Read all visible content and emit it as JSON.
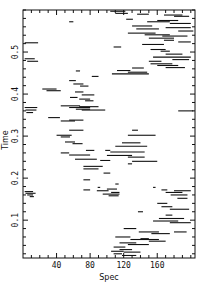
{
  "chart_data": {
    "type": "segments",
    "title": "",
    "xlabel": "Spec",
    "ylabel": "Time",
    "xlim": [
      0,
      205
    ],
    "ylim": [
      0.01,
      0.6
    ],
    "xticks": [
      40,
      80,
      120,
      160
    ],
    "xtick_labels": [
      "40",
      "80",
      "120",
      "160"
    ],
    "yticks": [
      0.1,
      0.2,
      0.3,
      0.4,
      0.5
    ],
    "ytick_labels": [
      "0.1",
      "0.2",
      "0.3",
      "0.4",
      "0.5"
    ],
    "x_minor_step": 10,
    "y_minor_step": 0.02,
    "grid": false,
    "legend": null,
    "segments": [
      {
        "x1": 104,
        "x2": 122,
        "y": 0.597
      },
      {
        "x1": 110,
        "x2": 125,
        "y": 0.592
      },
      {
        "x1": 136,
        "x2": 150,
        "y": 0.59
      },
      {
        "x1": 168,
        "x2": 190,
        "y": 0.588
      },
      {
        "x1": 180,
        "x2": 198,
        "y": 0.585
      },
      {
        "x1": 123,
        "x2": 131,
        "y": 0.578
      },
      {
        "x1": 160,
        "x2": 185,
        "y": 0.575
      },
      {
        "x1": 148,
        "x2": 175,
        "y": 0.572
      },
      {
        "x1": 175,
        "x2": 200,
        "y": 0.568
      },
      {
        "x1": 130,
        "x2": 154,
        "y": 0.562
      },
      {
        "x1": 170,
        "x2": 200,
        "y": 0.558
      },
      {
        "x1": 135,
        "x2": 162,
        "y": 0.555
      },
      {
        "x1": 185,
        "x2": 203,
        "y": 0.55
      },
      {
        "x1": 125,
        "x2": 158,
        "y": 0.545
      },
      {
        "x1": 145,
        "x2": 175,
        "y": 0.541
      },
      {
        "x1": 166,
        "x2": 196,
        "y": 0.538
      },
      {
        "x1": 150,
        "x2": 180,
        "y": 0.533
      },
      {
        "x1": 168,
        "x2": 180,
        "y": 0.528
      },
      {
        "x1": 185,
        "x2": 200,
        "y": 0.524
      },
      {
        "x1": 2,
        "x2": 18,
        "y": 0.522
      },
      {
        "x1": 142,
        "x2": 168,
        "y": 0.518
      },
      {
        "x1": 55,
        "x2": 60,
        "y": 0.572
      },
      {
        "x1": 108,
        "x2": 117,
        "y": 0.512
      },
      {
        "x1": 152,
        "x2": 170,
        "y": 0.506
      },
      {
        "x1": 164,
        "x2": 175,
        "y": 0.502
      },
      {
        "x1": 170,
        "x2": 190,
        "y": 0.495
      },
      {
        "x1": 155,
        "x2": 200,
        "y": 0.488
      },
      {
        "x1": 178,
        "x2": 198,
        "y": 0.482
      },
      {
        "x1": 2,
        "x2": 14,
        "y": 0.484
      },
      {
        "x1": 5,
        "x2": 18,
        "y": 0.478
      },
      {
        "x1": 150,
        "x2": 165,
        "y": 0.478
      },
      {
        "x1": 152,
        "x2": 178,
        "y": 0.472
      },
      {
        "x1": 160,
        "x2": 185,
        "y": 0.468
      },
      {
        "x1": 170,
        "x2": 193,
        "y": 0.463
      },
      {
        "x1": 130,
        "x2": 144,
        "y": 0.462
      },
      {
        "x1": 106,
        "x2": 150,
        "y": 0.448
      },
      {
        "x1": 125,
        "x2": 148,
        "y": 0.452
      },
      {
        "x1": 112,
        "x2": 128,
        "y": 0.456
      },
      {
        "x1": 63,
        "x2": 68,
        "y": 0.455
      },
      {
        "x1": 82,
        "x2": 90,
        "y": 0.442
      },
      {
        "x1": 55,
        "x2": 63,
        "y": 0.432
      },
      {
        "x1": 60,
        "x2": 72,
        "y": 0.424
      },
      {
        "x1": 68,
        "x2": 78,
        "y": 0.419
      },
      {
        "x1": 23,
        "x2": 40,
        "y": 0.412
      },
      {
        "x1": 28,
        "x2": 45,
        "y": 0.408
      },
      {
        "x1": 62,
        "x2": 72,
        "y": 0.405
      },
      {
        "x1": 70,
        "x2": 85,
        "y": 0.398
      },
      {
        "x1": 56,
        "x2": 65,
        "y": 0.392
      },
      {
        "x1": 67,
        "x2": 80,
        "y": 0.388
      },
      {
        "x1": 74,
        "x2": 84,
        "y": 0.384
      },
      {
        "x1": 45,
        "x2": 68,
        "y": 0.372
      },
      {
        "x1": 55,
        "x2": 80,
        "y": 0.368
      },
      {
        "x1": 67,
        "x2": 90,
        "y": 0.37
      },
      {
        "x1": 63,
        "x2": 80,
        "y": 0.364
      },
      {
        "x1": 70,
        "x2": 98,
        "y": 0.362
      },
      {
        "x1": 2,
        "x2": 17,
        "y": 0.368
      },
      {
        "x1": 3,
        "x2": 16,
        "y": 0.362
      },
      {
        "x1": 4,
        "x2": 12,
        "y": 0.356
      },
      {
        "x1": 185,
        "x2": 203,
        "y": 0.36
      },
      {
        "x1": 30,
        "x2": 44,
        "y": 0.344
      },
      {
        "x1": 45,
        "x2": 62,
        "y": 0.336
      },
      {
        "x1": 55,
        "x2": 72,
        "y": 0.338
      },
      {
        "x1": 55,
        "x2": 72,
        "y": 0.314
      },
      {
        "x1": 40,
        "x2": 58,
        "y": 0.302
      },
      {
        "x1": 45,
        "x2": 56,
        "y": 0.298
      },
      {
        "x1": 50,
        "x2": 62,
        "y": 0.286
      },
      {
        "x1": 59,
        "x2": 71,
        "y": 0.282
      },
      {
        "x1": 130,
        "x2": 137,
        "y": 0.314
      },
      {
        "x1": 125,
        "x2": 158,
        "y": 0.302
      },
      {
        "x1": 118,
        "x2": 140,
        "y": 0.284
      },
      {
        "x1": 110,
        "x2": 148,
        "y": 0.276
      },
      {
        "x1": 98,
        "x2": 104,
        "y": 0.266
      },
      {
        "x1": 75,
        "x2": 85,
        "y": 0.266
      },
      {
        "x1": 104,
        "x2": 145,
        "y": 0.262
      },
      {
        "x1": 45,
        "x2": 55,
        "y": 0.26
      },
      {
        "x1": 55,
        "x2": 80,
        "y": 0.255
      },
      {
        "x1": 100,
        "x2": 130,
        "y": 0.254
      },
      {
        "x1": 125,
        "x2": 145,
        "y": 0.25
      },
      {
        "x1": 62,
        "x2": 88,
        "y": 0.245
      },
      {
        "x1": 92,
        "x2": 104,
        "y": 0.242
      },
      {
        "x1": 130,
        "x2": 160,
        "y": 0.24
      },
      {
        "x1": 125,
        "x2": 130,
        "y": 0.234
      },
      {
        "x1": 72,
        "x2": 95,
        "y": 0.228
      },
      {
        "x1": 72,
        "x2": 90,
        "y": 0.222
      },
      {
        "x1": 96,
        "x2": 104,
        "y": 0.212
      },
      {
        "x1": 72,
        "x2": 80,
        "y": 0.196
      },
      {
        "x1": 110,
        "x2": 114,
        "y": 0.186
      },
      {
        "x1": 89,
        "x2": 92,
        "y": 0.178
      },
      {
        "x1": 155,
        "x2": 158,
        "y": 0.178
      },
      {
        "x1": 72,
        "x2": 80,
        "y": 0.172
      },
      {
        "x1": 88,
        "x2": 102,
        "y": 0.17
      },
      {
        "x1": 100,
        "x2": 112,
        "y": 0.174
      },
      {
        "x1": 105,
        "x2": 115,
        "y": 0.166
      },
      {
        "x1": 95,
        "x2": 115,
        "y": 0.162
      },
      {
        "x1": 102,
        "x2": 114,
        "y": 0.158
      },
      {
        "x1": 2,
        "x2": 12,
        "y": 0.168
      },
      {
        "x1": 3,
        "x2": 15,
        "y": 0.164
      },
      {
        "x1": 5,
        "x2": 12,
        "y": 0.16
      },
      {
        "x1": 8,
        "x2": 13,
        "y": 0.156
      },
      {
        "x1": 165,
        "x2": 172,
        "y": 0.172
      },
      {
        "x1": 180,
        "x2": 200,
        "y": 0.17
      },
      {
        "x1": 170,
        "x2": 190,
        "y": 0.166
      },
      {
        "x1": 176,
        "x2": 196,
        "y": 0.16
      },
      {
        "x1": 184,
        "x2": 196,
        "y": 0.152
      },
      {
        "x1": 160,
        "x2": 172,
        "y": 0.14
      },
      {
        "x1": 165,
        "x2": 178,
        "y": 0.132
      },
      {
        "x1": 175,
        "x2": 198,
        "y": 0.126
      },
      {
        "x1": 137,
        "x2": 143,
        "y": 0.12
      },
      {
        "x1": 170,
        "x2": 178,
        "y": 0.112
      },
      {
        "x1": 162,
        "x2": 192,
        "y": 0.104
      },
      {
        "x1": 155,
        "x2": 185,
        "y": 0.098
      },
      {
        "x1": 175,
        "x2": 200,
        "y": 0.094
      },
      {
        "x1": 120,
        "x2": 135,
        "y": 0.08
      },
      {
        "x1": 138,
        "x2": 162,
        "y": 0.072
      },
      {
        "x1": 153,
        "x2": 175,
        "y": 0.068
      },
      {
        "x1": 180,
        "x2": 195,
        "y": 0.072
      },
      {
        "x1": 110,
        "x2": 128,
        "y": 0.06
      },
      {
        "x1": 140,
        "x2": 150,
        "y": 0.056
      },
      {
        "x1": 128,
        "x2": 162,
        "y": 0.054
      },
      {
        "x1": 150,
        "x2": 170,
        "y": 0.05
      },
      {
        "x1": 115,
        "x2": 135,
        "y": 0.046
      },
      {
        "x1": 125,
        "x2": 150,
        "y": 0.042
      },
      {
        "x1": 108,
        "x2": 122,
        "y": 0.036
      },
      {
        "x1": 115,
        "x2": 130,
        "y": 0.03
      },
      {
        "x1": 105,
        "x2": 120,
        "y": 0.026
      },
      {
        "x1": 120,
        "x2": 140,
        "y": 0.024
      },
      {
        "x1": 108,
        "x2": 118,
        "y": 0.02
      },
      {
        "x1": 118,
        "x2": 135,
        "y": 0.016
      }
    ]
  }
}
